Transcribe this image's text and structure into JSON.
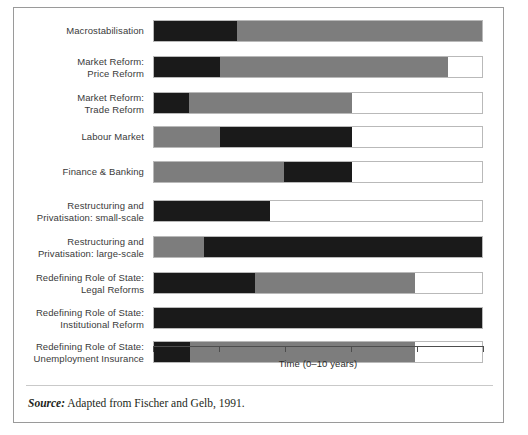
{
  "figure": {
    "axis_title": "Time (0–10 years)",
    "source_label": "Source:",
    "source_text": " Adapted from Fischer and Gelb, 1991."
  },
  "colors": {
    "phase1": "#1a1a1a",
    "phase2": "#7d7d7d",
    "remaining": "#ffffff",
    "frame": "#9a9a9a",
    "track_border": "#b9b9b9",
    "axis": "#4d4d4d",
    "label_text": "#3a3a3a"
  },
  "chart_data": {
    "type": "bar",
    "title": "",
    "subtitle": "",
    "xlabel": "Time (0–10 years)",
    "ylabel": "",
    "xlim": [
      0,
      10
    ],
    "xticks": [
      0,
      2,
      4,
      6,
      8,
      10
    ],
    "xtick_labels": [
      "",
      "",
      "",
      "",
      "",
      ""
    ],
    "grid": false,
    "legend_position": "none",
    "orientation": "horizontal",
    "stacked": true,
    "series": [
      {
        "name": "Phase 1",
        "color": "#1a1a1a"
      },
      {
        "name": "Phase 2",
        "color": "#7d7d7d"
      }
    ],
    "categories": [
      "Macrostabilisation",
      "Market Reform:\nPrice Reform",
      "Market Reform:\nTrade Reform",
      "Labour Market",
      "Finance & Banking",
      "Restructuring and\nPrivatisation: small-scale",
      "Restructuring and\nPrivatisation: large-scale",
      "Redefining Role of State:\nLegal Reforms",
      "Redefining Role of State:\nInstitutional Reform",
      "Redefining Role of State:\nUnemployment Insurance"
    ],
    "bars": [
      {
        "category": "Macrostabilisation",
        "segments": [
          {
            "series": "Phase 1",
            "start": 0.0,
            "end": 2.5
          },
          {
            "series": "Phase 2",
            "start": 2.5,
            "end": 10.0
          }
        ]
      },
      {
        "category": "Market Reform: Price Reform",
        "segments": [
          {
            "series": "Phase 1",
            "start": 0.0,
            "end": 2.0
          },
          {
            "series": "Phase 2",
            "start": 2.0,
            "end": 8.9
          }
        ]
      },
      {
        "category": "Market Reform: Trade Reform",
        "segments": [
          {
            "series": "Phase 1",
            "start": 0.0,
            "end": 1.05
          },
          {
            "series": "Phase 2",
            "start": 1.05,
            "end": 6.0
          }
        ]
      },
      {
        "category": "Labour Market",
        "segments": [
          {
            "series": "Phase 2",
            "start": 0.0,
            "end": 2.0
          },
          {
            "series": "Phase 1",
            "start": 2.0,
            "end": 6.0
          }
        ]
      },
      {
        "category": "Finance & Banking",
        "segments": [
          {
            "series": "Phase 2",
            "start": 0.0,
            "end": 3.95
          },
          {
            "series": "Phase 1",
            "start": 3.95,
            "end": 6.0
          }
        ]
      },
      {
        "category": "Restructuring and Privatisation: small-scale",
        "segments": [
          {
            "series": "Phase 1",
            "start": 0.0,
            "end": 3.5
          }
        ]
      },
      {
        "category": "Restructuring and Privatisation: large-scale",
        "segments": [
          {
            "series": "Phase 2",
            "start": 0.0,
            "end": 1.5
          },
          {
            "series": "Phase 1",
            "start": 1.5,
            "end": 10.0
          }
        ]
      },
      {
        "category": "Redefining Role of State: Legal Reforms",
        "segments": [
          {
            "series": "Phase 1",
            "start": 0.0,
            "end": 3.05
          },
          {
            "series": "Phase 2",
            "start": 3.05,
            "end": 7.9
          }
        ]
      },
      {
        "category": "Redefining Role of State: Institutional Reform",
        "segments": [
          {
            "series": "Phase 1",
            "start": 0.0,
            "end": 10.0
          }
        ]
      },
      {
        "category": "Redefining Role of State: Unemployment Insurance",
        "segments": [
          {
            "series": "Phase 1",
            "start": 0.0,
            "end": 1.1
          },
          {
            "series": "Phase 2",
            "start": 1.1,
            "end": 7.9
          }
        ]
      }
    ]
  },
  "row_tops": [
    12,
    48,
    84,
    118,
    153,
    192,
    228,
    264,
    299,
    333
  ]
}
